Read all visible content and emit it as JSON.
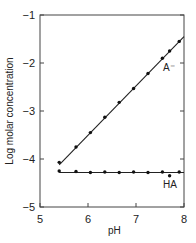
{
  "chart_data": {
    "type": "line",
    "title": "",
    "xlabel": "pH",
    "ylabel": "Log molar concentration",
    "xlim": [
      5,
      8
    ],
    "ylim": [
      -5,
      -1
    ],
    "xticks": [
      "5",
      "6",
      "7",
      "8"
    ],
    "yticks": [
      "-1",
      "-2",
      "-3",
      "-4",
      "-5"
    ],
    "grid": false,
    "series": [
      {
        "name": "A⁻",
        "label": "A⁻",
        "points": [
          [
            5.4,
            -4.07
          ],
          [
            5.75,
            -3.75
          ],
          [
            6.05,
            -3.45
          ],
          [
            6.35,
            -3.13
          ],
          [
            6.65,
            -2.82
          ],
          [
            6.95,
            -2.53
          ],
          [
            7.25,
            -2.22
          ],
          [
            7.55,
            -1.9
          ],
          [
            7.7,
            -1.75
          ],
          [
            7.9,
            -1.55
          ]
        ],
        "fit_line": [
          [
            5.4,
            -4.12
          ],
          [
            8.0,
            -1.45
          ]
        ]
      },
      {
        "name": "HA",
        "label": "HA",
        "points": [
          [
            5.4,
            -4.25
          ],
          [
            5.75,
            -4.26
          ],
          [
            6.05,
            -4.28
          ],
          [
            6.35,
            -4.27
          ],
          [
            6.65,
            -4.28
          ],
          [
            6.95,
            -4.27
          ],
          [
            7.25,
            -4.28
          ],
          [
            7.55,
            -4.27
          ],
          [
            7.7,
            -4.35
          ],
          [
            7.9,
            -4.27
          ]
        ],
        "fit_line": [
          [
            5.4,
            -4.28
          ],
          [
            8.0,
            -4.28
          ]
        ]
      }
    ]
  }
}
